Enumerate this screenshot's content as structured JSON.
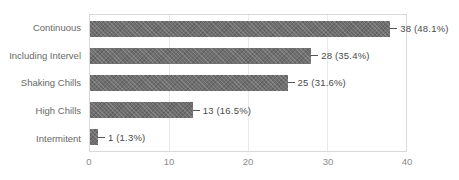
{
  "chart_data": {
    "type": "bar",
    "orientation": "horizontal",
    "title": "",
    "xlabel": "",
    "ylabel": "",
    "categories": [
      "Continuous",
      "Including Intervel",
      "Shaking Chills",
      "High Chills",
      "Intermitent"
    ],
    "values": [
      38,
      28,
      25,
      13,
      1
    ],
    "annotations": [
      "38 (48.1%)",
      "28 (35.4%)",
      "25 (31.6%)",
      "13 (16.5%)",
      "1 (1.3%)"
    ],
    "xticks": [
      "0",
      "10",
      "20",
      "30",
      "40"
    ],
    "xlim": [
      0,
      40
    ],
    "grid": "vertical-gridlines",
    "legend": "none",
    "colors": {
      "bar_fill": "#6f6f6f",
      "plot_border": "#d9d9d9",
      "gridline": "#e9e9e9",
      "category_text": "#676767",
      "annotation_text": "#4a4a4a",
      "tick_text": "#8a8a8a",
      "background": "#ffffff"
    }
  }
}
